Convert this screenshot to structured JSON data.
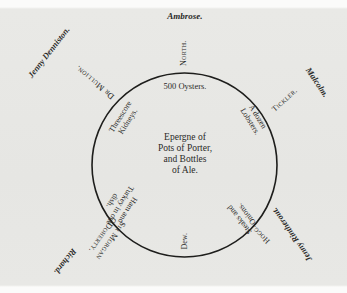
{
  "diagram": {
    "type": "seating-arrangement",
    "table": {
      "shape": "circle",
      "centerpiece": "Epergne of\nPots of Porter,\nand Bottles\nof Ale."
    },
    "dishes": [
      {
        "id": "oysters",
        "text": "500 Oysters."
      },
      {
        "id": "lobsters",
        "text": "A dozen\nLobsters."
      },
      {
        "id": "steaks",
        "text": "Steaks and\nOnions."
      },
      {
        "id": "ham",
        "text": "Ham and\nTurkey in one\ndish."
      },
      {
        "id": "kidneys",
        "text": "Threescore\nKidneys."
      }
    ],
    "seated": [
      {
        "id": "north",
        "text": "North."
      },
      {
        "id": "tickler",
        "text": "Tickler."
      },
      {
        "id": "hogg",
        "text": "Hogg."
      },
      {
        "id": "dew",
        "text": "Dew."
      },
      {
        "id": "odoherty",
        "text": "Sir Morgan\nODoherty."
      },
      {
        "id": "mullion",
        "text": "Dr Mullion."
      }
    ],
    "attendants": [
      {
        "id": "ambrose",
        "text": "Ambrose."
      },
      {
        "id": "malcolm",
        "text": "Malcolm."
      },
      {
        "id": "jenny-rintherout",
        "text": "Jenny Rintherout."
      },
      {
        "id": "richard",
        "text": "Richard."
      },
      {
        "id": "jenny-dennistoun",
        "text": "Jenny Denniston."
      }
    ]
  },
  "colors": {
    "ink": "#2a2a28",
    "paper": "#e6e6e3"
  }
}
